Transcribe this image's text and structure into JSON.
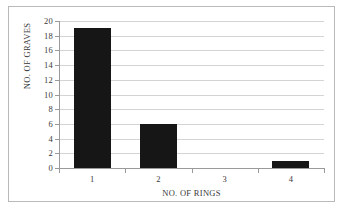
{
  "figure": {
    "border_color": "#b9b9b9",
    "background": "#ffffff"
  },
  "chart_data": {
    "type": "bar",
    "title": "",
    "categories": [
      "1",
      "2",
      "3",
      "4"
    ],
    "values": [
      19,
      6,
      0,
      1
    ],
    "series": [
      {
        "name": "NO. OF GRAVES",
        "values": [
          19,
          6,
          0,
          1
        ]
      }
    ],
    "xlabel": "NO. OF RINGS",
    "ylabel": "NO. OF GRAVES",
    "ylim": [
      0,
      20
    ],
    "ytick_step": 2,
    "yticks": [
      0,
      2,
      4,
      6,
      8,
      10,
      12,
      14,
      16,
      18,
      20
    ],
    "ytick_labels": [
      "0",
      "2",
      "4",
      "6",
      "8",
      "10",
      "12",
      "14",
      "16",
      "18",
      "20"
    ],
    "xticks": [
      "1",
      "2",
      "3",
      "4"
    ],
    "grid": "horizontal",
    "legend": "none",
    "bar_color": "#161616",
    "gridline_color": "#d4d4d4",
    "axis_color": "#9a9a9a"
  }
}
